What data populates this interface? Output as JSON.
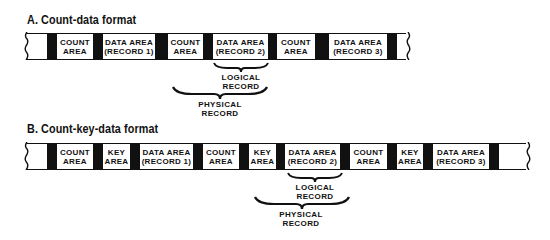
{
  "diagram_a": {
    "title": "A. Count-data format",
    "segments": [
      {
        "kind": "blank",
        "width": 20,
        "text": ""
      },
      {
        "kind": "gap",
        "width": 10,
        "text": ""
      },
      {
        "kind": "area",
        "width": 36,
        "text": "COUNT\nAREA"
      },
      {
        "kind": "gap",
        "width": 10,
        "text": ""
      },
      {
        "kind": "area",
        "width": 52,
        "text": "DATA AREA\n(RECORD 1)"
      },
      {
        "kind": "gap",
        "width": 13,
        "text": ""
      },
      {
        "kind": "area",
        "width": 35,
        "text": "COUNT\nAREA"
      },
      {
        "kind": "gap",
        "width": 10,
        "text": ""
      },
      {
        "kind": "area",
        "width": 55,
        "text": "DATA AREA\n(RECORD 2)"
      },
      {
        "kind": "gap",
        "width": 9,
        "text": ""
      },
      {
        "kind": "area",
        "width": 38,
        "text": "COUNT\nAREA"
      },
      {
        "kind": "gap",
        "width": 14,
        "text": ""
      },
      {
        "kind": "area",
        "width": 58,
        "text": "DATA AREA\n(RECORD 3)"
      },
      {
        "kind": "gap",
        "width": 10,
        "text": ""
      },
      {
        "kind": "blank",
        "width": 11,
        "text": ""
      }
    ],
    "logical_label": "LOGICAL\nRECORD",
    "physical_label": "PHYSICAL\nRECORD"
  },
  "diagram_b": {
    "title": "B. Count-key-data format",
    "segments": [
      {
        "kind": "blank",
        "width": 20,
        "text": ""
      },
      {
        "kind": "gap",
        "width": 10,
        "text": ""
      },
      {
        "kind": "area",
        "width": 36,
        "text": "COUNT\nAREA"
      },
      {
        "kind": "gap",
        "width": 10,
        "text": ""
      },
      {
        "kind": "area",
        "width": 27,
        "text": "KEY\nAREA"
      },
      {
        "kind": "gap",
        "width": 10,
        "text": ""
      },
      {
        "kind": "area",
        "width": 53,
        "text": "DATA AREA\n(RECORD 1)"
      },
      {
        "kind": "gap",
        "width": 10,
        "text": ""
      },
      {
        "kind": "area",
        "width": 36,
        "text": "COUNT\nAREA"
      },
      {
        "kind": "gap",
        "width": 10,
        "text": ""
      },
      {
        "kind": "area",
        "width": 27,
        "text": "KEY\nAREA"
      },
      {
        "kind": "gap",
        "width": 9,
        "text": ""
      },
      {
        "kind": "area",
        "width": 55,
        "text": "DATA AREA\n(RECORD 2)"
      },
      {
        "kind": "gap",
        "width": 10,
        "text": ""
      },
      {
        "kind": "area",
        "width": 37,
        "text": "COUNT\nAREA"
      },
      {
        "kind": "gap",
        "width": 10,
        "text": ""
      },
      {
        "kind": "area",
        "width": 26,
        "text": "KEY\nAREA"
      },
      {
        "kind": "gap",
        "width": 10,
        "text": ""
      },
      {
        "kind": "area",
        "width": 56,
        "text": "DATA AREA\n(RECORD 3)"
      },
      {
        "kind": "gap",
        "width": 10,
        "text": ""
      },
      {
        "kind": "blank",
        "width": 16,
        "text": ""
      }
    ],
    "logical_label": "LOGICAL\nRECORD",
    "physical_label": "PHYSICAL\nRECORD"
  }
}
